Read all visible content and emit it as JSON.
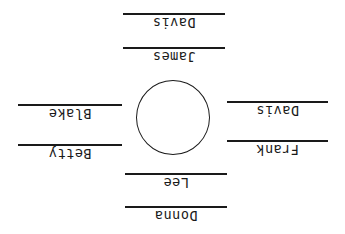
{
  "diagram": {
    "table": {
      "shape": "circle"
    },
    "seats": {
      "top": [
        {
          "line": 1,
          "name": "Davis"
        },
        {
          "line": 2,
          "name": "James"
        }
      ],
      "left": [
        {
          "line": 1,
          "name": "Blake"
        },
        {
          "line": 2,
          "name": "Betty"
        }
      ],
      "right": [
        {
          "line": 1,
          "name": "Davis"
        },
        {
          "line": 2,
          "name": "Frank"
        }
      ],
      "bottom": [
        {
          "line": 1,
          "name": "Lee"
        },
        {
          "line": 2,
          "name": "Donna"
        }
      ]
    },
    "colors": {
      "ink": "#1a1a1a",
      "background": "#ffffff"
    }
  }
}
